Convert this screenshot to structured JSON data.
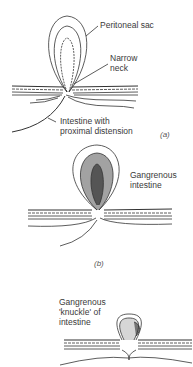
{
  "figure": {
    "panels": [
      {
        "id": "a",
        "panel_label": "(a)",
        "labels": {
          "sac": "Peritoneal sac",
          "neck": "Narrow\nneck",
          "intestine": "Intestine with\nproximal distension"
        }
      },
      {
        "id": "b",
        "panel_label": "(b)",
        "labels": {
          "gangrene": "Gangrenous\nintestine"
        }
      },
      {
        "id": "c",
        "panel_label": "",
        "labels": {
          "knuckle": "Gangrenous\n'knuckle' of\nintestine"
        }
      }
    ]
  }
}
